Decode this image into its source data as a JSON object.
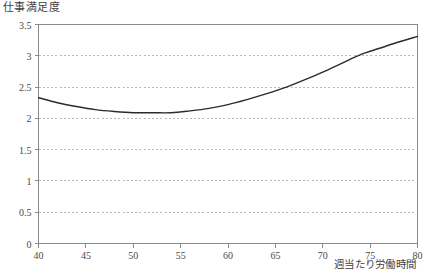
{
  "chart_data": {
    "type": "line",
    "title": "",
    "ylabel": "仕事満足度",
    "xlabel": "週当たり労働時間",
    "xlim": [
      40,
      80
    ],
    "ylim": [
      0,
      3.5
    ],
    "xticks": [
      40,
      45,
      50,
      55,
      60,
      65,
      70,
      75,
      80
    ],
    "yticks": [
      0,
      0.5,
      1,
      1.5,
      2,
      2.5,
      3,
      3.5
    ],
    "xtick_labels": [
      "40",
      "45",
      "50",
      "55",
      "60",
      "65",
      "70",
      "75",
      "80"
    ],
    "ytick_labels": [
      "0",
      "0.5",
      "1",
      "1.5",
      "2",
      "2.5",
      "3",
      "3.5"
    ],
    "grid": true,
    "grid_axis": "y",
    "grid_style": "dotted",
    "legend": false,
    "series": [
      {
        "name": "仕事満足度",
        "color": "#2b2b2b",
        "x": [
          40,
          42,
          44,
          46,
          48,
          50,
          52,
          54,
          56,
          58,
          60,
          62,
          64,
          66,
          68,
          70,
          72,
          74,
          76,
          78,
          80
        ],
        "y": [
          2.33,
          2.25,
          2.19,
          2.14,
          2.11,
          2.09,
          2.09,
          2.09,
          2.12,
          2.16,
          2.22,
          2.3,
          2.39,
          2.49,
          2.61,
          2.74,
          2.88,
          3.02,
          3.12,
          3.22,
          3.31
        ]
      }
    ],
    "colors": {
      "curve": "#2b2b2b",
      "axis": "#8a8a8a",
      "grid": "#b9b9b9",
      "text": "#3f3f3f",
      "background": "#ffffff"
    }
  }
}
